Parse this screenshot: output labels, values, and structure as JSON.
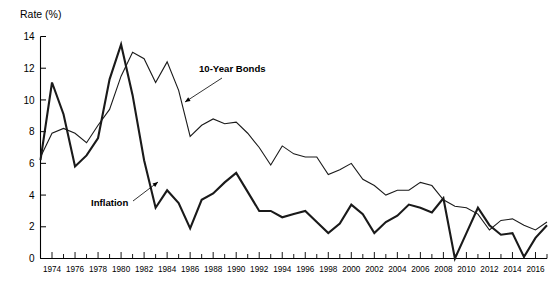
{
  "chart_data": {
    "type": "line",
    "title": "",
    "ylabel": "Rate (%)",
    "xlabel": "",
    "ylim": [
      0,
      14
    ],
    "xlim": [
      1973,
      2017
    ],
    "y_ticks": [
      0,
      2,
      4,
      6,
      8,
      10,
      12,
      14
    ],
    "x_ticks": [
      1973,
      1974,
      1975,
      1976,
      1977,
      1978,
      1979,
      1980,
      1981,
      1982,
      1983,
      1984,
      1985,
      1986,
      1987,
      1988,
      1989,
      1990,
      1991,
      1992,
      1993,
      1994,
      1995,
      1996,
      1997,
      1998,
      1999,
      2000,
      2001,
      2002,
      2003,
      2004,
      2005,
      2006,
      2007,
      2008,
      2009,
      2010,
      2011,
      2012,
      2013,
      2014,
      2015,
      2016,
      2017
    ],
    "x_tick_labels": [
      "",
      "1974",
      "",
      "1976",
      "",
      "1978",
      "",
      "1980",
      "",
      "1982",
      "",
      "1984",
      "",
      "1986",
      "",
      "1988",
      "",
      "1990",
      "",
      "1992",
      "",
      "1994",
      "",
      "1996",
      "",
      "1998",
      "",
      "2000",
      "",
      "2002",
      "",
      "2004",
      "",
      "2006",
      "",
      "2008",
      "",
      "2010",
      "",
      "2012",
      "",
      "2014",
      "",
      "2016",
      ""
    ],
    "grid": false,
    "legend_position": "inline-annotation",
    "annotations": [
      {
        "text": "10-Year Bonds",
        "target_series": "10-Year Bonds",
        "text_x": 199,
        "text_y": 72,
        "arrow_from_x": 222,
        "arrow_from_y": 78,
        "arrow_to_x": 185,
        "arrow_to_y": 102
      },
      {
        "text": "Inflation",
        "target_series": "Inflation",
        "text_x": 91,
        "text_y": 206,
        "arrow_from_x": 133,
        "arrow_from_y": 201,
        "arrow_to_x": 158,
        "arrow_to_y": 182
      }
    ],
    "x": [
      1973,
      1974,
      1975,
      1976,
      1977,
      1978,
      1979,
      1980,
      1981,
      1982,
      1983,
      1984,
      1985,
      1986,
      1987,
      1988,
      1989,
      1990,
      1991,
      1992,
      1993,
      1994,
      1995,
      1996,
      1997,
      1998,
      1999,
      2000,
      2001,
      2002,
      2003,
      2004,
      2005,
      2006,
      2007,
      2008,
      2009,
      2010,
      2011,
      2012,
      2013,
      2014,
      2015,
      2016,
      2017
    ],
    "series": [
      {
        "name": "10-Year Bonds",
        "color": "#1a1a1a",
        "line_width": 1.1,
        "values": [
          6.4,
          7.9,
          8.2,
          7.9,
          7.3,
          8.4,
          9.4,
          11.5,
          13.0,
          12.6,
          11.1,
          12.4,
          10.6,
          7.7,
          8.4,
          8.8,
          8.5,
          8.6,
          7.9,
          7.0,
          5.9,
          7.1,
          6.6,
          6.4,
          6.4,
          5.3,
          5.6,
          6.0,
          5.0,
          4.6,
          4.0,
          4.3,
          4.3,
          4.8,
          4.6,
          3.7,
          3.3,
          3.2,
          2.8,
          1.8,
          2.4,
          2.5,
          2.1,
          1.8,
          2.3
        ]
      },
      {
        "name": "Inflation",
        "color": "#1a1a1a",
        "line_width": 2.1,
        "values": [
          6.2,
          11.1,
          9.1,
          5.8,
          6.5,
          7.6,
          11.3,
          13.5,
          10.3,
          6.2,
          3.2,
          4.3,
          3.5,
          1.9,
          3.7,
          4.1,
          4.8,
          5.4,
          4.2,
          3.0,
          3.0,
          2.6,
          2.8,
          3.0,
          2.3,
          1.6,
          2.2,
          3.4,
          2.8,
          1.6,
          2.3,
          2.7,
          3.4,
          3.2,
          2.9,
          3.8,
          0.0,
          1.6,
          3.2,
          2.1,
          1.5,
          1.6,
          0.1,
          1.3,
          2.1
        ]
      }
    ]
  }
}
